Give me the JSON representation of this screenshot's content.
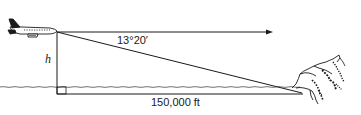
{
  "diagram": {
    "labels": {
      "angle": "13°20′",
      "height": "h",
      "distance": "150,000 ft"
    },
    "elements": {
      "airplane": "airplane-icon",
      "horizontal_arrow": "line of sight arrow pointing right",
      "vertical_line": "altitude h",
      "diagonal": "line of sight to cliff base",
      "water": "wavy water surface",
      "cliff": "rocky cliff on the right",
      "right_angle": "right-angle marker"
    },
    "colors": {
      "stroke": "#1a1a1a",
      "background": "#ffffff"
    }
  }
}
